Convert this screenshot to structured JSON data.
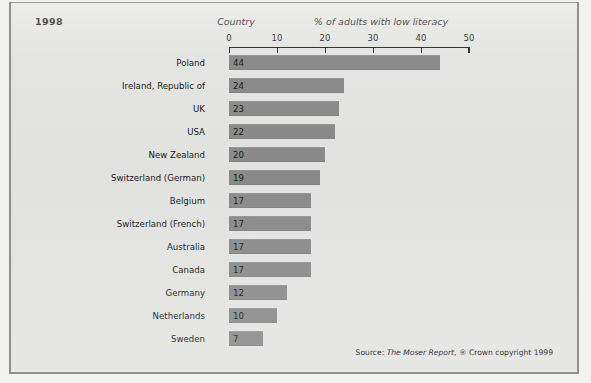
{
  "year": "1998",
  "headers": {
    "country": "Country",
    "percent": "% of adults with low literacy"
  },
  "source": {
    "prefix": "Source: ",
    "title": "The Moser Report",
    "suffix": ", ® Crown copyright 1999"
  },
  "colors": {
    "background": "#e4e4e2",
    "bar": "#8b8b8b",
    "axis": "#2b2b2b",
    "text": "#1b1b1b",
    "border": "#8f8f8d"
  },
  "chart_data": {
    "type": "bar",
    "orientation": "horizontal",
    "title": "% of adults with low literacy",
    "subtitle": "1998",
    "xlabel": "% of adults with low literacy",
    "ylabel": "Country",
    "xlim": [
      0,
      50
    ],
    "xticks": [
      0,
      10,
      20,
      30,
      40,
      50
    ],
    "grid": false,
    "legend": false,
    "categories": [
      "Poland",
      "Ireland, Republic of",
      "UK",
      "USA",
      "New Zealand",
      "Switzerland (German)",
      "Belgium",
      "Switzerland (French)",
      "Australia",
      "Canada",
      "Germany",
      "Netherlands",
      "Sweden"
    ],
    "values": [
      44,
      24,
      23,
      22,
      20,
      19,
      17,
      17,
      17,
      17,
      12,
      10,
      7
    ],
    "value_labels": [
      "44",
      "24",
      "23",
      "22",
      "20",
      "19",
      "17",
      "17",
      "17",
      "17",
      "12",
      "10",
      "7"
    ],
    "tick_labels": [
      "0",
      "10",
      "20",
      "30",
      "40",
      "50"
    ]
  }
}
